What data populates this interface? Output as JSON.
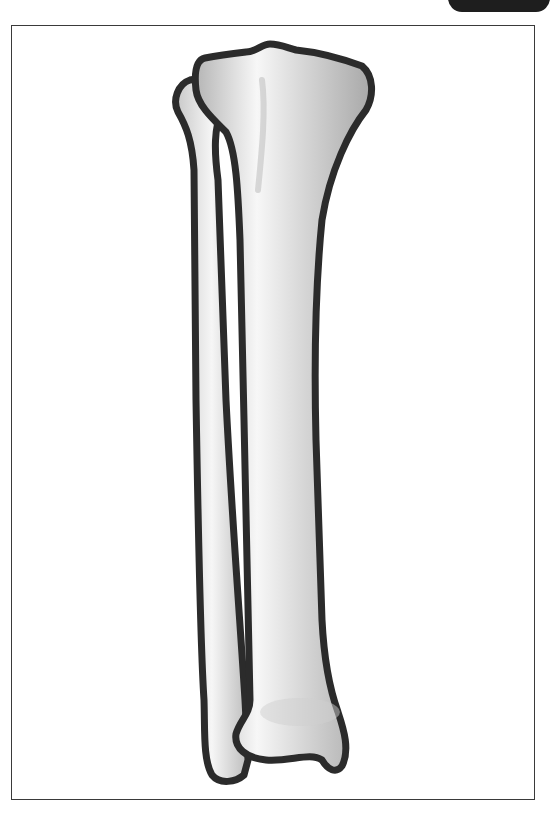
{
  "figure": {
    "bones": [
      {
        "name": "tibia",
        "label": "Tibia"
      },
      {
        "name": "fibula",
        "label": "Fibula"
      }
    ],
    "colors": {
      "outline": "#2b2b2b",
      "bone_light": "#f4f4f4",
      "bone_shade": "#b8b8b8",
      "tab": "#1e1e1e",
      "frame": "#3a3a3a"
    }
  }
}
